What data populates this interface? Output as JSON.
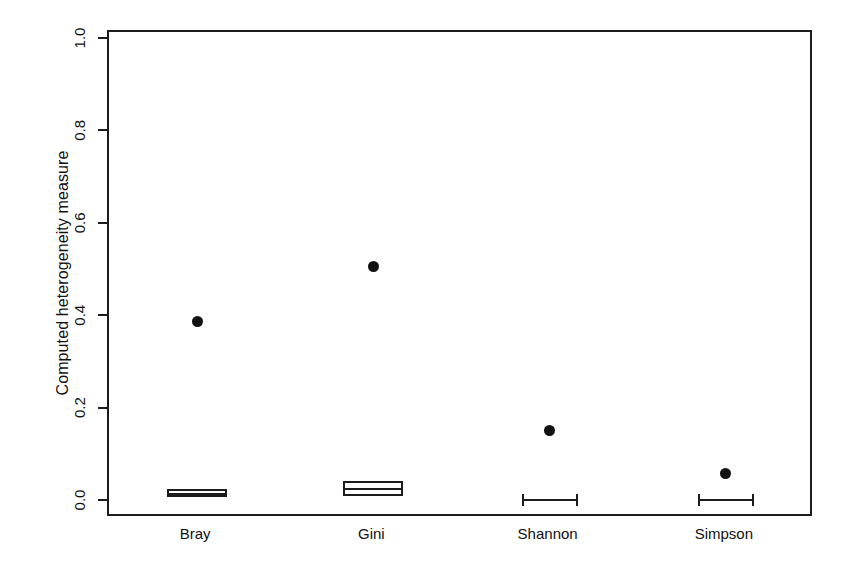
{
  "chart_data": {
    "type": "boxplot",
    "title": "",
    "xlabel": "",
    "ylabel": "Computed heterogeneity measure",
    "categories": [
      "Bray",
      "Gini",
      "Shannon",
      "Simpson"
    ],
    "ylim": [
      0.0,
      1.0
    ],
    "ytick_values": [
      0.0,
      0.2,
      0.4,
      0.6,
      0.8,
      1.0
    ],
    "ytick_labels": [
      "0.0",
      "0.2",
      "0.4",
      "0.6",
      "0.8",
      "1.0"
    ],
    "grid": false,
    "legend": "none",
    "boxes": [
      {
        "category": "Bray",
        "q1": 0.01,
        "median": 0.018,
        "q3": 0.028,
        "whisker_low": 0.01,
        "whisker_high": 0.028,
        "outliers": [
          0.39
        ]
      },
      {
        "category": "Gini",
        "q1": 0.012,
        "median": 0.028,
        "q3": 0.046,
        "whisker_low": 0.012,
        "whisker_high": 0.046,
        "outliers": [
          0.51
        ]
      },
      {
        "category": "Shannon",
        "q1": 0.004,
        "median": 0.004,
        "q3": 0.004,
        "whisker_low": 0.004,
        "whisker_high": 0.004,
        "outliers": [
          0.155
        ]
      },
      {
        "category": "Simpson",
        "q1": 0.004,
        "median": 0.004,
        "q3": 0.004,
        "whisker_low": 0.004,
        "whisker_high": 0.004,
        "outliers": [
          0.062
        ]
      }
    ],
    "colors": {
      "axis": "#1c1c1c",
      "box_fill": "#ffffff",
      "box_stroke": "#1c1c1c",
      "outlier": "#111111",
      "background": "#ffffff"
    }
  }
}
